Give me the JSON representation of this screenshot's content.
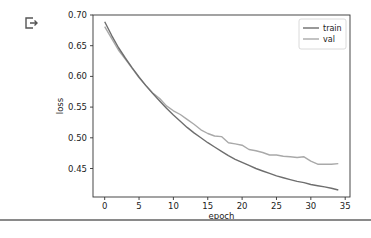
{
  "output_icon": "output-arrow-icon",
  "chart_data": {
    "type": "line",
    "title": "",
    "xlabel": "epoch",
    "ylabel": "loss",
    "xlim": [
      -1.7,
      35.7
    ],
    "ylim": [
      0.4036,
      0.7
    ],
    "xticks": [
      0,
      5,
      10,
      15,
      20,
      25,
      30,
      35
    ],
    "yticks": [
      0.45,
      0.5,
      0.55,
      0.6,
      0.65,
      0.7
    ],
    "ytick_labels": [
      "0.45",
      "0.50",
      "0.55",
      "0.60",
      "0.65",
      "0.70"
    ],
    "legend_position": "upper right",
    "grid": false,
    "x": [
      0,
      1,
      2,
      3,
      4,
      5,
      6,
      7,
      8,
      9,
      10,
      11,
      12,
      13,
      14,
      15,
      16,
      17,
      18,
      19,
      20,
      21,
      22,
      23,
      24,
      25,
      26,
      27,
      28,
      29,
      30,
      31,
      32,
      33,
      34
    ],
    "series": [
      {
        "name": "train",
        "color": "#6e6e6e",
        "values": [
          0.689,
          0.667,
          0.647,
          0.63,
          0.614,
          0.599,
          0.585,
          0.572,
          0.56,
          0.548,
          0.537,
          0.527,
          0.517,
          0.508,
          0.5,
          0.492,
          0.485,
          0.478,
          0.471,
          0.465,
          0.46,
          0.455,
          0.45,
          0.446,
          0.442,
          0.438,
          0.435,
          0.432,
          0.429,
          0.427,
          0.424,
          0.422,
          0.42,
          0.418,
          0.415
        ]
      },
      {
        "name": "val",
        "color": "#a9a9a9",
        "values": [
          0.681,
          0.662,
          0.643,
          0.628,
          0.613,
          0.598,
          0.585,
          0.573,
          0.564,
          0.552,
          0.544,
          0.538,
          0.53,
          0.522,
          0.513,
          0.507,
          0.503,
          0.502,
          0.492,
          0.49,
          0.488,
          0.481,
          0.479,
          0.476,
          0.472,
          0.472,
          0.47,
          0.469,
          0.468,
          0.469,
          0.462,
          0.457,
          0.457,
          0.457,
          0.458
        ]
      }
    ]
  }
}
